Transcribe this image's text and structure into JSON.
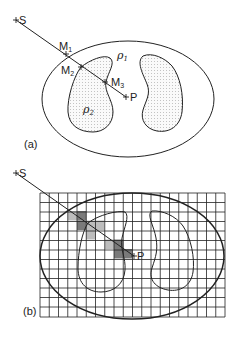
{
  "figure": {
    "panel_a": {
      "label": "(a)",
      "source": {
        "name": "S"
      },
      "point": {
        "name": "P"
      },
      "intersections": [
        {
          "name": "M",
          "sub": "1"
        },
        {
          "name": "M",
          "sub": "2"
        },
        {
          "name": "M",
          "sub": "3"
        }
      ],
      "regions": [
        {
          "symbol": "ρ",
          "sub": "1"
        },
        {
          "symbol": "ρ",
          "sub": "2"
        }
      ]
    },
    "panel_b": {
      "label": "(b)",
      "source": {
        "name": "S"
      },
      "point": {
        "name": "P"
      },
      "grid": {
        "columns": 20,
        "rows": 13
      }
    },
    "colors": {
      "line": "#222222",
      "stipple": "#9a9a9a",
      "shade_dark": "#7a7a7a",
      "shade_light": "#bdbdbd"
    }
  }
}
